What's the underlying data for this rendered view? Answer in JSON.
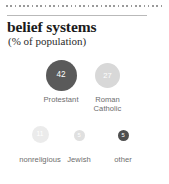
{
  "header": {
    "title": "belief systems",
    "subtitle": "(% of population)"
  },
  "chart_data": {
    "type": "bubble",
    "title": "belief systems",
    "subtitle": "(% of population)",
    "unit": "% of population",
    "categories": [
      "Protestant",
      "Roman Catholic",
      "nonreligious",
      "Jewish",
      "other"
    ],
    "values": [
      42,
      27,
      11,
      5,
      5
    ],
    "value_labels": [
      "42",
      "27",
      "11",
      "5",
      "5"
    ],
    "legend": "none",
    "grid": false,
    "bubbles": [
      {
        "label": "Protestant",
        "value": 42,
        "value_label": "42",
        "color": "#5a5a5a",
        "text_color": "#ffffff",
        "diameter_px": 31,
        "font_px": 8.2,
        "left_px": 30,
        "top_px": 60,
        "width_px": 62,
        "label_top_px": 36
      },
      {
        "label": "Roman Catholic",
        "value": 27,
        "value_label": "27",
        "color": "#d8d8d8",
        "text_color": "#ffffff",
        "diameter_px": 25,
        "font_px": 7.6,
        "left_px": 87,
        "top_px": 63,
        "width_px": 41,
        "label_top_px": 33
      },
      {
        "label": "nonreligious",
        "value": 11,
        "value_label": "11",
        "color": "#ebebeb",
        "text_color": "#ffffff",
        "diameter_px": 17,
        "font_px": 6.6,
        "left_px": 11,
        "top_px": 126,
        "width_px": 58,
        "label_top_px": 30
      },
      {
        "label": "Jewish",
        "value": 5,
        "value_label": "5",
        "color": "#e0e0e0",
        "text_color": "#ffffff",
        "diameter_px": 11,
        "font_px": 5.8,
        "left_px": 58,
        "top_px": 130,
        "width_px": 42,
        "label_top_px": 26
      },
      {
        "label": "other",
        "value": 5,
        "value_label": "5",
        "color": "#4f4f4f",
        "text_color": "#ffffff",
        "diameter_px": 11,
        "font_px": 5.8,
        "left_px": 104,
        "top_px": 130,
        "width_px": 38,
        "label_top_px": 26
      }
    ]
  },
  "style": {
    "accent_dark": "#5a5a5a",
    "accent_light": "#d8d8d8",
    "accent_lightest": "#ebebeb",
    "background": "#ffffff",
    "rule_color": "#b9b9b9",
    "dot_color": "#9a9a9a",
    "label_color": "#6d6d6d",
    "title_color": "#1b1b1b"
  }
}
